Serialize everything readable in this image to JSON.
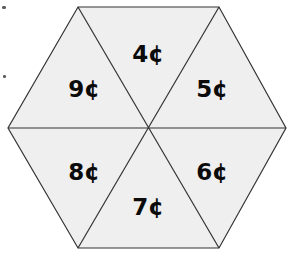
{
  "figure": {
    "title": "Hexagon divided into six triangular sectors",
    "shape_name": "hexagon",
    "sector_count": 6,
    "fill_color": "#efefef",
    "stroke_color": "#333333",
    "background_color": "#ffffff",
    "label_color": "#0b0b0b",
    "stroke_width": 1.2,
    "geometry": {
      "center": {
        "x": 148,
        "y": 128
      },
      "vertices": [
        {
          "x": 78,
          "y": 7
        },
        {
          "x": 219,
          "y": 7
        },
        {
          "x": 286,
          "y": 128
        },
        {
          "x": 219,
          "y": 248
        },
        {
          "x": 78,
          "y": 248
        },
        {
          "x": 8,
          "y": 128
        }
      ]
    },
    "sectors": [
      {
        "id": "top",
        "label": "4¢",
        "value": 4,
        "unit": "cent",
        "label_x": 148,
        "label_y": 55
      },
      {
        "id": "upper-right",
        "label": "5¢",
        "value": 5,
        "unit": "cent",
        "label_x": 212,
        "label_y": 90
      },
      {
        "id": "lower-right",
        "label": "6¢",
        "value": 6,
        "unit": "cent",
        "label_x": 212,
        "label_y": 173
      },
      {
        "id": "bottom",
        "label": "7¢",
        "value": 7,
        "unit": "cent",
        "label_x": 148,
        "label_y": 208
      },
      {
        "id": "lower-left",
        "label": "8¢",
        "value": 8,
        "unit": "cent",
        "label_x": 84,
        "label_y": 173
      },
      {
        "id": "upper-left",
        "label": "9¢",
        "value": 9,
        "unit": "cent",
        "label_x": 84,
        "label_y": 90
      }
    ],
    "dividers": [
      {
        "id": "horizontal-divider",
        "x1": 8,
        "y1": 128,
        "x2": 286,
        "y2": 128
      },
      {
        "id": "diagonal-nw-se",
        "x1": 78,
        "y1": 7,
        "x2": 219,
        "y2": 248
      },
      {
        "id": "diagonal-ne-sw",
        "x1": 219,
        "y1": 7,
        "x2": 78,
        "y2": 248
      }
    ],
    "artifacts": [
      {
        "id": "scan-speck-top-left",
        "x": 2,
        "y": 6,
        "w": 4,
        "h": 3
      },
      {
        "id": "scan-speck-left-mid",
        "x": 3,
        "y": 75,
        "w": 3,
        "h": 3
      }
    ]
  }
}
